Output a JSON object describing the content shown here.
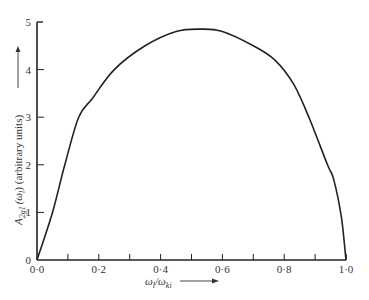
{
  "chart_data": {
    "type": "line",
    "title": "",
    "xlabel": "ω_l/ω_ki",
    "ylabel": "A_2g1(ω_l) (arbitrary units)",
    "xlim": [
      0.0,
      1.0
    ],
    "ylim": [
      0,
      5
    ],
    "grid": false,
    "legend": null,
    "x_ticks": [
      "0·0",
      "0·2",
      "0·4",
      "0·6",
      "0·8",
      "1·0"
    ],
    "x_minor_ticks": [
      0.1,
      0.3,
      0.5,
      0.7,
      0.9
    ],
    "y_ticks": [
      "0",
      "1",
      "2",
      "3",
      "4",
      "5"
    ],
    "series": [
      {
        "name": "A_2g1",
        "x": [
          0.0,
          0.05,
          0.09,
          0.135,
          0.18,
          0.25,
          0.35,
          0.45,
          0.53,
          0.6,
          0.7,
          0.77,
          0.83,
          0.88,
          0.94,
          0.96,
          0.985,
          1.0
        ],
        "y": [
          0.0,
          1.0,
          2.0,
          3.0,
          3.4,
          4.0,
          4.5,
          4.8,
          4.85,
          4.8,
          4.5,
          4.2,
          3.7,
          3.0,
          2.0,
          1.7,
          0.9,
          0.0
        ]
      }
    ]
  },
  "labels": {
    "y_axis_main": "A",
    "y_axis_sub": "2g1",
    "y_axis_rest": "(ω",
    "y_axis_rest_sub": "l",
    "y_axis_tail": ") (arbitrary units)",
    "x_axis_main": "ω",
    "x_axis_sub1": "l",
    "x_axis_slash": "/ω",
    "x_axis_sub2": "ki"
  }
}
